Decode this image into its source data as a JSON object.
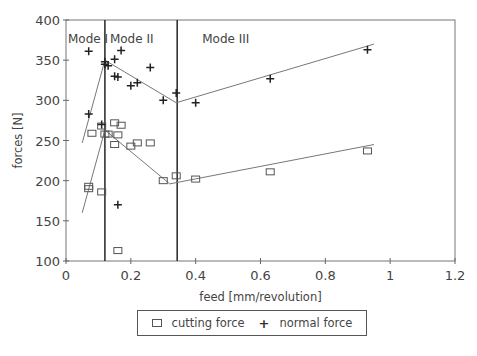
{
  "chart_data": {
    "type": "scatter",
    "title": "",
    "xlabel": "feed [mm/revolution]",
    "ylabel": "forces [N]",
    "xlim": [
      0,
      1.2
    ],
    "ylim": [
      100,
      400
    ],
    "x_ticks": [
      "0",
      "0.2",
      "0.4",
      "0.6",
      "0.8",
      "1",
      "1.2"
    ],
    "y_ticks": [
      "100",
      "150",
      "200",
      "250",
      "300",
      "350",
      "400"
    ],
    "grid": false,
    "legend_position": "bottom-center",
    "regions": [
      {
        "label": "Mode I",
        "x_start": 0,
        "x_end": 0.12
      },
      {
        "label": "Mode II",
        "x_start": 0.12,
        "x_end": 0.343
      },
      {
        "label": "Mode III",
        "x_start": 0.343,
        "x_end": 1.2
      }
    ],
    "vertical_lines": [
      0.12,
      0.343
    ],
    "series": [
      {
        "name": "cutting force",
        "marker": "square",
        "points": [
          [
            0.07,
            193
          ],
          [
            0.07,
            190
          ],
          [
            0.08,
            259
          ],
          [
            0.11,
            186
          ],
          [
            0.11,
            268
          ],
          [
            0.12,
            258
          ],
          [
            0.13,
            258
          ],
          [
            0.15,
            272
          ],
          [
            0.15,
            245
          ],
          [
            0.16,
            257
          ],
          [
            0.17,
            269
          ],
          [
            0.2,
            243
          ],
          [
            0.22,
            247
          ],
          [
            0.26,
            247
          ],
          [
            0.3,
            200
          ],
          [
            0.34,
            206
          ],
          [
            0.4,
            202
          ],
          [
            0.63,
            211
          ],
          [
            0.93,
            237
          ],
          [
            0.16,
            113
          ]
        ],
        "fit_line": [
          [
            0.05,
            160
          ],
          [
            0.12,
            263
          ],
          [
            0.32,
            196
          ],
          [
            0.95,
            245
          ]
        ]
      },
      {
        "name": "normal force",
        "marker": "plus",
        "points": [
          [
            0.07,
            361
          ],
          [
            0.07,
            283
          ],
          [
            0.11,
            270
          ],
          [
            0.12,
            345
          ],
          [
            0.12,
            348
          ],
          [
            0.13,
            343
          ],
          [
            0.15,
            351
          ],
          [
            0.15,
            330
          ],
          [
            0.16,
            329
          ],
          [
            0.17,
            362
          ],
          [
            0.2,
            318
          ],
          [
            0.22,
            322
          ],
          [
            0.26,
            341
          ],
          [
            0.3,
            300
          ],
          [
            0.34,
            309
          ],
          [
            0.4,
            297
          ],
          [
            0.63,
            327
          ],
          [
            0.93,
            363
          ],
          [
            0.16,
            170
          ]
        ],
        "fit_line": [
          [
            0.05,
            247
          ],
          [
            0.12,
            350
          ],
          [
            0.34,
            297
          ],
          [
            0.95,
            370
          ]
        ]
      }
    ]
  },
  "legend": {
    "items": [
      {
        "label": "cutting force",
        "symbol": "square"
      },
      {
        "label": "normal force",
        "symbol": "plus"
      }
    ]
  }
}
